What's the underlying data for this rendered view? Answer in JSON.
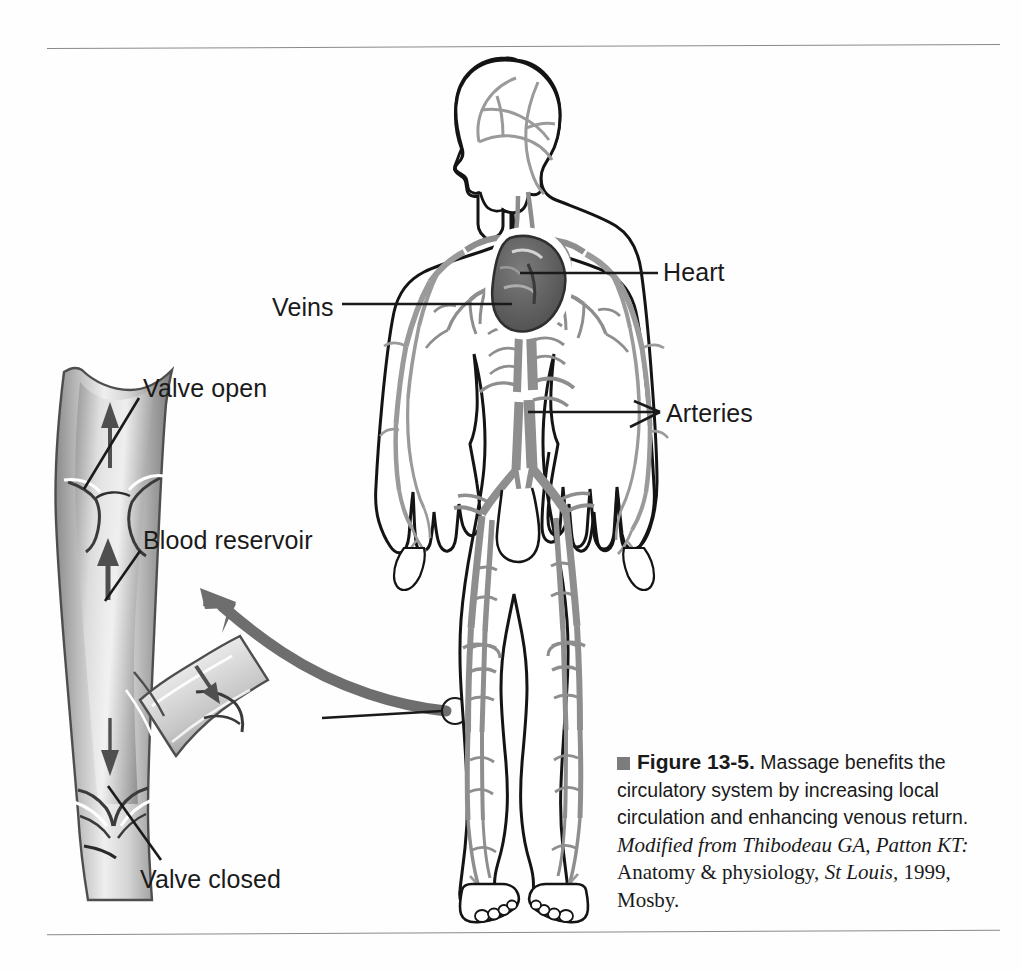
{
  "figure": {
    "number": "13-5",
    "figure_word": "Figure",
    "bullet_color": "#7c7c7c",
    "caption_main": "Massage benefits the circulatory system by increasing local circulation and enhancing venous return.",
    "source_italic_1": "Modified from Thibodeau GA, Patton KT:",
    "source_roman_1": "Anatomy & physiology,",
    "source_italic_2": "St Louis,",
    "source_roman_2": "1999, Mosby."
  },
  "labels": {
    "valve_open": "Valve open",
    "blood_reservoir": "Blood reservoir",
    "valve_closed": "Valve closed",
    "veins": "Veins",
    "heart": "Heart",
    "arteries": "Arteries"
  },
  "colors": {
    "ink": "#1a1a1a",
    "rule": "#8a8a8a",
    "vessel_gray": "#8e8e8e",
    "vessel_dark": "#5a5a5a",
    "heart_fill": "#6b6b6b",
    "arrow_gray": "#6e6e6e",
    "page": "#ffffff"
  },
  "diagram": {
    "left_panel": "vein cross-section with valves",
    "right_panel": "human body circulatory system, anterior view",
    "callout": "magnified calf vein region",
    "flow_arrows_up": 2,
    "flow_arrows_down": 2
  }
}
